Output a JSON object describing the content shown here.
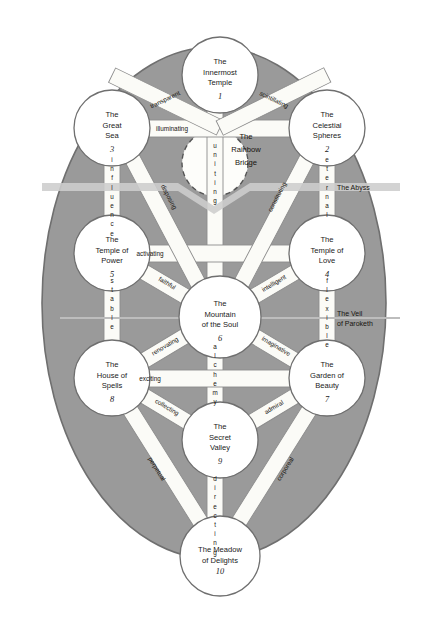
{
  "diagram": {
    "background_color": "#ffffff",
    "ellipse_color": "#9a9a9a",
    "ellipse_border_color": "#6f6f6f",
    "node_fill": "#ffffff",
    "node_border": "#6f6f6f",
    "path_fill": "#fbfbf7",
    "path_border": "#8d8d8d",
    "zone_band_color": "#c9c9c9"
  },
  "nodes": [
    {
      "id": "n1",
      "name": "The Innermost\nTemple",
      "line1": "The",
      "line2": "Innermost",
      "line3": "Temple",
      "number": "1",
      "cx": 220,
      "cy": 75,
      "r": 38
    },
    {
      "id": "n2",
      "name": "The Celestial Spheres",
      "line1": "The",
      "line2": "Celestial",
      "line3": "Spheres",
      "number": "2",
      "cx": 327,
      "cy": 128,
      "r": 38
    },
    {
      "id": "n3",
      "name": "The Great Sea",
      "line1": "The",
      "line2": "Great",
      "line3": "Sea",
      "number": "3",
      "cx": 112,
      "cy": 128,
      "r": 38
    },
    {
      "id": "n4",
      "name": "The Temple of Love",
      "line1": "The",
      "line2": "Temple of",
      "line3": "Love",
      "number": "4",
      "cx": 327,
      "cy": 253,
      "r": 38
    },
    {
      "id": "n5",
      "name": "The Temple of Power",
      "line1": "The",
      "line2": "Temple of",
      "line3": "Power",
      "number": "5",
      "cx": 112,
      "cy": 253,
      "r": 38
    },
    {
      "id": "n6",
      "name": "The Mountain of the Soul",
      "line1": "The",
      "line2": "Mountain",
      "line3": "of the Soul",
      "number": "6",
      "cx": 220,
      "cy": 317,
      "r": 41
    },
    {
      "id": "n7",
      "name": "The Garden of Beauty",
      "line1": "The",
      "line2": "Garden of",
      "line3": "Beauty",
      "number": "7",
      "cx": 327,
      "cy": 378,
      "r": 38
    },
    {
      "id": "n8",
      "name": "The House of Spells",
      "line1": "The",
      "line2": "House of",
      "line3": "Spells",
      "number": "8",
      "cx": 112,
      "cy": 378,
      "r": 38
    },
    {
      "id": "n9",
      "name": "The Secret Valley",
      "line1": "The",
      "line2": "Secret",
      "line3": "Valley",
      "number": "9",
      "cx": 220,
      "cy": 440,
      "r": 38
    },
    {
      "id": "n10",
      "name": "The Meadow of Delights",
      "line1": "The Meadow",
      "line2": "of Delights",
      "line3": "",
      "number": "10",
      "cx": 220,
      "cy": 556,
      "r": 40
    }
  ],
  "paths": [
    {
      "id": "p_1_3",
      "label": "transparent",
      "from": "n1",
      "to": "n3",
      "orientation": "diagonal"
    },
    {
      "id": "p_1_2",
      "label": "scintillating",
      "from": "n1",
      "to": "n2",
      "orientation": "diagonal"
    },
    {
      "id": "p_3_2",
      "label": "illuminating",
      "from": "n3",
      "to": "n2",
      "orientation": "horizontal"
    },
    {
      "id": "p_1_6",
      "label": "uniting",
      "from": "n1",
      "to": "n6",
      "orientation": "vertical"
    },
    {
      "id": "p_3_5",
      "label": "influence",
      "from": "n3",
      "to": "n5",
      "orientation": "vertical"
    },
    {
      "id": "p_2_4",
      "label": "eternal",
      "from": "n2",
      "to": "n4",
      "orientation": "vertical"
    },
    {
      "id": "p_3_6",
      "label": "disposing",
      "from": "n3",
      "to": "n6",
      "orientation": "diagonal"
    },
    {
      "id": "p_2_6",
      "label": "constituting",
      "from": "n2",
      "to": "n6",
      "orientation": "diagonal"
    },
    {
      "id": "p_5_4",
      "label": "activating",
      "from": "n5",
      "to": "n4",
      "orientation": "horizontal"
    },
    {
      "id": "p_5_6",
      "label": "faithful",
      "from": "n5",
      "to": "n6",
      "orientation": "diagonal"
    },
    {
      "id": "p_4_6",
      "label": "intelligent",
      "from": "n4",
      "to": "n6",
      "orientation": "diagonal"
    },
    {
      "id": "p_5_8",
      "label": "stable",
      "from": "n5",
      "to": "n8",
      "orientation": "vertical"
    },
    {
      "id": "p_4_7",
      "label": "flexible",
      "from": "n4",
      "to": "n7",
      "orientation": "vertical"
    },
    {
      "id": "p_6_8",
      "label": "renovating",
      "from": "n6",
      "to": "n8",
      "orientation": "diagonal"
    },
    {
      "id": "p_6_7",
      "label": "imaginative",
      "from": "n6",
      "to": "n7",
      "orientation": "diagonal"
    },
    {
      "id": "p_6_9",
      "label": "alchemy",
      "from": "n6",
      "to": "n9",
      "orientation": "vertical"
    },
    {
      "id": "p_8_7",
      "label": "exciting",
      "from": "n8",
      "to": "n7",
      "orientation": "horizontal"
    },
    {
      "id": "p_8_9",
      "label": "collecting",
      "from": "n8",
      "to": "n9",
      "orientation": "diagonal"
    },
    {
      "id": "p_7_9",
      "label": "admiral",
      "from": "n7",
      "to": "n9",
      "orientation": "diagonal"
    },
    {
      "id": "p_8_10",
      "label": "perpetual",
      "from": "n8",
      "to": "n10",
      "orientation": "diagonal"
    },
    {
      "id": "p_7_10",
      "label": "corporeal",
      "from": "n7",
      "to": "n10",
      "orientation": "diagonal"
    },
    {
      "id": "p_9_10",
      "label": "directing",
      "from": "n9",
      "to": "n10",
      "orientation": "vertical"
    }
  ],
  "zones": [
    {
      "id": "abyss",
      "label": "The Abyss",
      "y": 187
    },
    {
      "id": "paroketh",
      "label_line1": "The Veil",
      "label_line2": "of Paroketh",
      "y": 315
    }
  ],
  "bridge": {
    "id": "rainbow-bridge",
    "line1": "The",
    "line2": "Rainbow",
    "line3": "Bridge",
    "cx": 246,
    "cy": 150
  }
}
